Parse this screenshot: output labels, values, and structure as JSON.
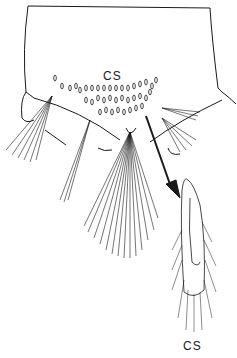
{
  "figure": {
    "labels": {
      "top": "CS",
      "bottom": "CS"
    },
    "colors": {
      "ink": "#1a1a1a",
      "background": "#ffffff"
    }
  }
}
